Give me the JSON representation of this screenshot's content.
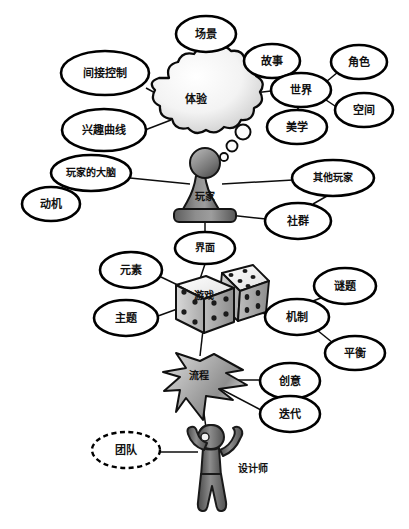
{
  "diagram": {
    "type": "mind-map",
    "background_color": "#ffffff",
    "line_color": "#0d0d0d",
    "node_fill": "#ffffff",
    "node_stroke": "#000000",
    "center_nodes": [
      {
        "id": "experience",
        "label": "体验",
        "shape": "cloud",
        "x": 196,
        "y": 99
      },
      {
        "id": "player",
        "label": "玩家",
        "shape": "chess-pawn",
        "x": 205,
        "y": 198
      },
      {
        "id": "game",
        "label": "游戏",
        "shape": "dice",
        "x": 204,
        "y": 297
      },
      {
        "id": "process",
        "label": "流程",
        "shape": "arrow",
        "x": 199,
        "y": 378
      },
      {
        "id": "designer",
        "label": "设计师",
        "shape": "human-figure",
        "x": 211,
        "y": 470
      }
    ],
    "ellipse_nodes": [
      {
        "id": "scene",
        "label": "场景",
        "x": 206,
        "y": 34,
        "rx": 30,
        "ry": 18,
        "dashed": false
      },
      {
        "id": "indirect-control",
        "label": "间接控制",
        "x": 105,
        "y": 73,
        "rx": 44,
        "ry": 22,
        "dashed": false
      },
      {
        "id": "interest-curve",
        "label": "兴趣曲线",
        "x": 104,
        "y": 130,
        "rx": 42,
        "ry": 21,
        "dashed": false
      },
      {
        "id": "story",
        "label": "故事",
        "x": 272,
        "y": 61,
        "rx": 28,
        "ry": 17,
        "dashed": false
      },
      {
        "id": "role",
        "label": "角色",
        "x": 359,
        "y": 62,
        "rx": 28,
        "ry": 17,
        "dashed": false
      },
      {
        "id": "world",
        "label": "世界",
        "x": 301,
        "y": 90,
        "rx": 30,
        "ry": 17,
        "dashed": false
      },
      {
        "id": "space",
        "label": "空间",
        "x": 364,
        "y": 110,
        "rx": 29,
        "ry": 17,
        "dashed": false
      },
      {
        "id": "aesthetics",
        "label": "美学",
        "x": 297,
        "y": 127,
        "rx": 30,
        "ry": 17,
        "dashed": false
      },
      {
        "id": "player-brain",
        "label": "玩家的大脑",
        "x": 91,
        "y": 173,
        "rx": 40,
        "ry": 18,
        "dashed": false
      },
      {
        "id": "motivation",
        "label": "动机",
        "x": 51,
        "y": 204,
        "rx": 29,
        "ry": 17,
        "dashed": false
      },
      {
        "id": "other-players",
        "label": "其他玩家",
        "x": 333,
        "y": 178,
        "rx": 41,
        "ry": 18,
        "dashed": false
      },
      {
        "id": "community",
        "label": "社群",
        "x": 298,
        "y": 221,
        "rx": 33,
        "ry": 18,
        "dashed": false
      },
      {
        "id": "interface",
        "label": "界面",
        "x": 205,
        "y": 248,
        "rx": 30,
        "ry": 16,
        "dashed": false
      },
      {
        "id": "elements",
        "label": "元素",
        "x": 131,
        "y": 270,
        "rx": 31,
        "ry": 18,
        "dashed": false
      },
      {
        "id": "theme",
        "label": "主题",
        "x": 126,
        "y": 318,
        "rx": 32,
        "ry": 18,
        "dashed": false
      },
      {
        "id": "puzzle",
        "label": "谜题",
        "x": 345,
        "y": 286,
        "rx": 31,
        "ry": 18,
        "dashed": false
      },
      {
        "id": "mechanics",
        "label": "机制",
        "x": 297,
        "y": 317,
        "rx": 32,
        "ry": 18,
        "dashed": false
      },
      {
        "id": "balance",
        "label": "平衡",
        "x": 355,
        "y": 353,
        "rx": 30,
        "ry": 17,
        "dashed": false
      },
      {
        "id": "creativity",
        "label": "创意",
        "x": 290,
        "y": 381,
        "rx": 30,
        "ry": 18,
        "dashed": false
      },
      {
        "id": "iteration",
        "label": "迭代",
        "x": 290,
        "y": 414,
        "rx": 30,
        "ry": 18,
        "dashed": false
      },
      {
        "id": "team",
        "label": "团队",
        "x": 126,
        "y": 450,
        "rx": 34,
        "ry": 18,
        "dashed": true
      }
    ],
    "edges": [
      {
        "from": "experience",
        "to": "scene"
      },
      {
        "from": "experience",
        "to": "indirect-control"
      },
      {
        "from": "experience",
        "to": "interest-curve"
      },
      {
        "from": "experience",
        "to": "world"
      },
      {
        "from": "world",
        "to": "story"
      },
      {
        "from": "world",
        "to": "role"
      },
      {
        "from": "world",
        "to": "space"
      },
      {
        "from": "world",
        "to": "aesthetics"
      },
      {
        "from": "player",
        "to": "player-brain"
      },
      {
        "from": "player-brain",
        "to": "motivation"
      },
      {
        "from": "player",
        "to": "other-players"
      },
      {
        "from": "other-players",
        "to": "community"
      },
      {
        "from": "player",
        "to": "community"
      },
      {
        "from": "player",
        "to": "interface"
      },
      {
        "from": "interface",
        "to": "game"
      },
      {
        "from": "game",
        "to": "elements"
      },
      {
        "from": "game",
        "to": "theme"
      },
      {
        "from": "game",
        "to": "mechanics"
      },
      {
        "from": "mechanics",
        "to": "puzzle"
      },
      {
        "from": "mechanics",
        "to": "balance"
      },
      {
        "from": "game",
        "to": "process"
      },
      {
        "from": "process",
        "to": "creativity"
      },
      {
        "from": "process",
        "to": "iteration"
      },
      {
        "from": "process",
        "to": "designer"
      },
      {
        "from": "designer",
        "to": "team"
      }
    ],
    "thought_bubbles": [
      {
        "cx": 243,
        "cy": 132,
        "r": 7.5
      },
      {
        "cx": 233,
        "cy": 146,
        "r": 5.5
      },
      {
        "cx": 225,
        "cy": 156,
        "r": 4.0
      }
    ]
  }
}
